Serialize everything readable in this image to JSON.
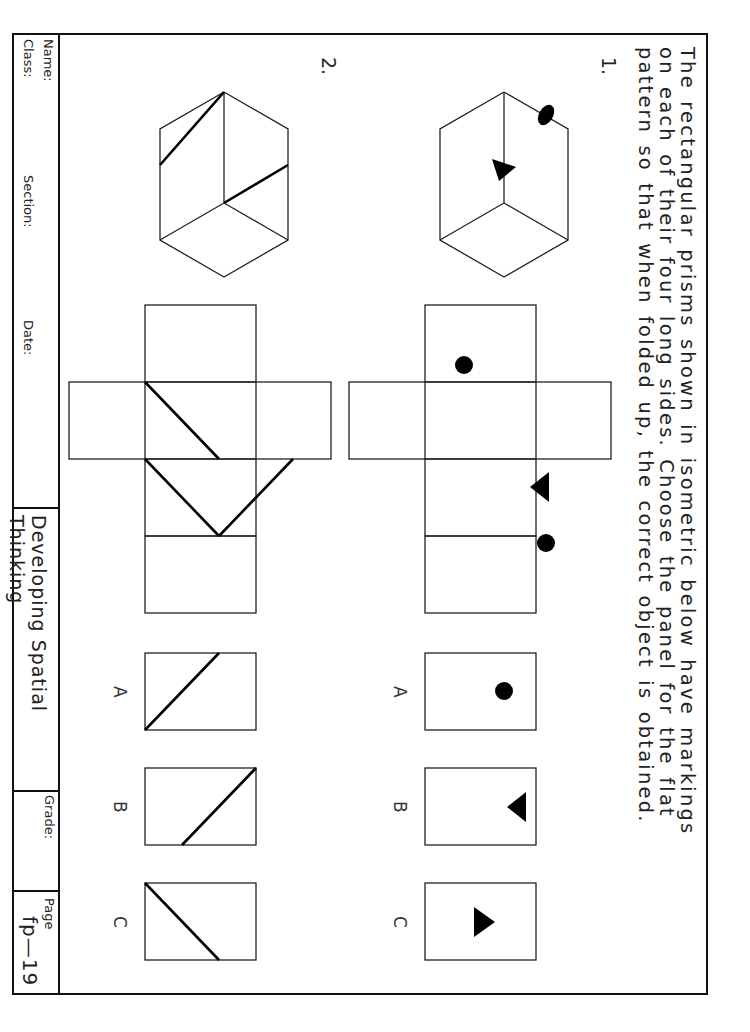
{
  "instructions": [
    "The rectangular prisms shown in isometric below have markings",
    "on each of their four long sides. Choose the panel for the flat",
    "pattern so that when folded up, the correct object is obtained."
  ],
  "problems": [
    {
      "number": "1.",
      "isometric": {
        "marks": [
          "ellipse-dot on top face",
          "triangle on front face"
        ]
      },
      "net_marks": [
        "dot (top panel)",
        "right-pointing triangle (third panel)",
        "dot (bottom panel)"
      ],
      "options": [
        {
          "label": "A",
          "mark": "dot"
        },
        {
          "label": "B",
          "mark": "right-pointing triangle"
        },
        {
          "label": "C",
          "mark": "left-pointing triangle"
        }
      ]
    },
    {
      "number": "2.",
      "isometric": {
        "marks": [
          "diagonal line on top face",
          "diagonal line on front face"
        ]
      },
      "net_marks": [
        "diagonal (top panel)",
        "diagonal (second panel)",
        "diagonal (third panel)"
      ],
      "options": [
        {
          "label": "A",
          "mark": "diagonal from top-middle to bottom-right"
        },
        {
          "label": "B",
          "mark": "diagonal from top-left to bottom-middle"
        },
        {
          "label": "C",
          "mark": "diagonal from bottom-middle to top-right"
        }
      ]
    }
  ],
  "title_block": {
    "name_label": "Name:",
    "class_label": "Class:",
    "section_label": "Section:",
    "date_label": "Date:",
    "title": "Developing Spatial Thinking",
    "grade_label": "Grade:",
    "page_label": "Page",
    "page_number": "fp—19"
  }
}
